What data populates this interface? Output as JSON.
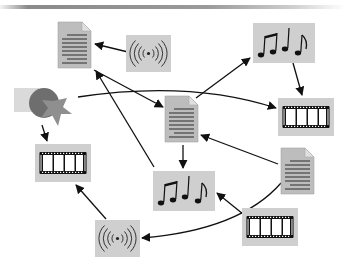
{
  "diagram": {
    "type": "media-flow",
    "colors": {
      "tile_bg": "#cfcfcf",
      "doc_fill": "#bdbdbd",
      "doc_lines": "#3a3a3a",
      "arrow": "#111111",
      "square": "#dadada",
      "circle": "#6e6e6e",
      "star": "#8f8f8f"
    },
    "nodes": [
      {
        "id": "doc1",
        "kind": "document",
        "icon": "document-icon"
      },
      {
        "id": "radio1",
        "kind": "broadcast",
        "icon": "broadcast-icon"
      },
      {
        "id": "music1",
        "kind": "music",
        "icon": "music-notes-icon"
      },
      {
        "id": "shapes",
        "kind": "shapes",
        "icon": "shapes-icon"
      },
      {
        "id": "film1",
        "kind": "film",
        "icon": "film-strip-icon"
      },
      {
        "id": "doc2",
        "kind": "document",
        "icon": "document-icon"
      },
      {
        "id": "film2",
        "kind": "film",
        "icon": "film-strip-icon"
      },
      {
        "id": "doc3",
        "kind": "document",
        "icon": "document-icon"
      },
      {
        "id": "music2",
        "kind": "music",
        "icon": "music-notes-icon"
      },
      {
        "id": "film3",
        "kind": "film",
        "icon": "film-strip-icon"
      },
      {
        "id": "radio2",
        "kind": "broadcast",
        "icon": "broadcast-icon"
      }
    ],
    "edges": [
      {
        "from": "radio1",
        "to": "doc1"
      },
      {
        "from": "doc1",
        "to": "doc2"
      },
      {
        "from": "doc2",
        "to": "music1"
      },
      {
        "from": "music1",
        "to": "film1"
      },
      {
        "from": "shapes",
        "to": "film1"
      },
      {
        "from": "shapes",
        "to": "film2"
      },
      {
        "from": "doc2",
        "to": "music2"
      },
      {
        "from": "doc3",
        "to": "doc2"
      },
      {
        "from": "doc3",
        "to": "radio2"
      },
      {
        "from": "radio2",
        "to": "film2"
      },
      {
        "from": "film3",
        "to": "music2"
      },
      {
        "from": "music2",
        "to": "doc1"
      }
    ]
  }
}
